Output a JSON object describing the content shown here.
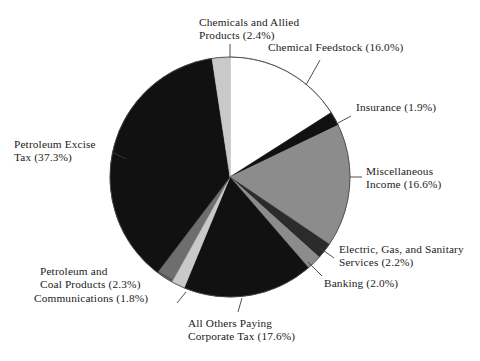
{
  "chart_data": {
    "type": "pie",
    "title": "",
    "subtitle": "",
    "xlabel": "",
    "ylabel": "",
    "legend_position": "none",
    "grid": false,
    "labels_outside": true,
    "start_angle_deg": 90,
    "direction": "clockwise",
    "total_percent": 100.1,
    "categories": [
      "Chemical Feedstock",
      "Insurance",
      "Miscellaneous Income",
      "Electric, Gas, and Sanitary Services",
      "Banking",
      "All Others Paying Corporate Tax",
      "Communications",
      "Petroleum and Coal Products",
      "Petroleum Excise Tax",
      "Chemicals and Allied Products"
    ],
    "values": [
      16.0,
      1.9,
      16.6,
      2.2,
      2.0,
      17.6,
      1.8,
      2.3,
      37.3,
      2.4
    ],
    "slice_colors": [
      "#ffffff",
      "#111111",
      "#8c8c8c",
      "#2b2b2b",
      "#8c8c8c",
      "#111111",
      "#c9c9c9",
      "#6e6e6e",
      "#111111",
      "#c9c9c9"
    ],
    "slices": [
      {
        "name": "Chemical Feedstock",
        "value": 16.0,
        "label": "Chemical Feedstock  (16.0%)",
        "color": "#ffffff"
      },
      {
        "name": "Insurance",
        "value": 1.9,
        "label": "Insurance  (1.9%)",
        "color": "#111111"
      },
      {
        "name": "Miscellaneous Income",
        "value": 16.6,
        "label": "Miscellaneous\nIncome  (16.6%)",
        "color": "#8c8c8c"
      },
      {
        "name": "Electric, Gas, and Sanitary Services",
        "value": 2.2,
        "label": "Electric, Gas, and Sanitary\nServices  (2.2%)",
        "color": "#2b2b2b"
      },
      {
        "name": "Banking",
        "value": 2.0,
        "label": "Banking  (2.0%)",
        "color": "#8c8c8c"
      },
      {
        "name": "All Others Paying Corporate Tax",
        "value": 17.6,
        "label": "All Others Paying\nCorporate Tax  (17.6%)",
        "color": "#111111"
      },
      {
        "name": "Communications",
        "value": 1.8,
        "label": "Communications  (1.8%)",
        "color": "#c9c9c9"
      },
      {
        "name": "Petroleum and Coal Products",
        "value": 2.3,
        "label": "Petroleum and\nCoal Products  (2.3%)",
        "color": "#6e6e6e"
      },
      {
        "name": "Petroleum Excise Tax",
        "value": 37.3,
        "label": "Petroleum Excise\nTax  (37.3%)",
        "color": "#111111"
      },
      {
        "name": "Chemicals and Allied Products",
        "value": 2.4,
        "label": "Chemicals and Allied\nProducts  (2.4%)",
        "color": "#c9c9c9"
      }
    ]
  },
  "labels": {
    "chemicals_allied": "Chemicals and Allied\nProducts  (2.4%)",
    "chemical_feedstock": "Chemical Feedstock  (16.0%)",
    "insurance": "Insurance  (1.9%)",
    "misc_income": "Miscellaneous\nIncome  (16.6%)",
    "electric_gas": "Electric, Gas, and Sanitary\nServices  (2.2%)",
    "banking": "Banking  (2.0%)",
    "all_others": "All Others Paying\nCorporate Tax  (17.6%)",
    "communications": "Communications  (1.8%)",
    "petroleum_coal": "Petroleum and\nCoal Products  (2.3%)",
    "petroleum_excise": "Petroleum Excise\nTax  (37.3%)"
  },
  "colors": {
    "background": "#ffffff",
    "text": "#1b1b1b",
    "outline": "#4a4a4a",
    "black_slice": "#111111",
    "dark_gray_slice": "#2b2b2b",
    "mid_dark_gray_slice": "#6e6e6e",
    "gray_slice": "#8c8c8c",
    "light_gray_slice": "#c9c9c9",
    "white_slice": "#ffffff"
  }
}
